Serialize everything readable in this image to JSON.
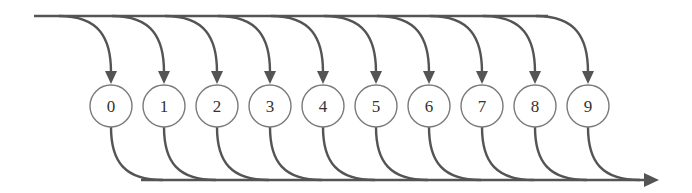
{
  "diagram": {
    "nodes": [
      {
        "label": "0"
      },
      {
        "label": "1"
      },
      {
        "label": "2"
      },
      {
        "label": "3"
      },
      {
        "label": "4"
      },
      {
        "label": "5"
      },
      {
        "label": "6"
      },
      {
        "label": "7"
      },
      {
        "label": "8"
      },
      {
        "label": "9"
      }
    ],
    "colors": {
      "line": "#545454",
      "node_stroke": "#7a7a7a",
      "node_fill": "#ffffff",
      "text": "#333333",
      "background": "#ffffff"
    }
  }
}
